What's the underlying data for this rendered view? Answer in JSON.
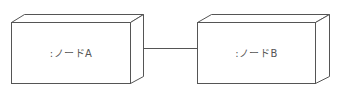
{
  "diagram": {
    "type": "UML deployment diagram",
    "nodes": [
      {
        "id": "A",
        "label": ":ノードA",
        "front": {
          "x": 11,
          "y": 22,
          "w": 119,
          "h": 61
        },
        "depth": {
          "dx": 13,
          "dy": -8
        }
      },
      {
        "id": "B",
        "label": ":ノードB",
        "front": {
          "x": 197,
          "y": 22,
          "w": 118,
          "h": 61
        },
        "depth": {
          "dx": 14,
          "dy": -8
        }
      }
    ],
    "connections": [
      {
        "from": "A",
        "to": "B",
        "y": 48
      }
    ],
    "colors": {
      "stroke": "#555555",
      "text": "#555555",
      "background": "#ffffff"
    }
  }
}
